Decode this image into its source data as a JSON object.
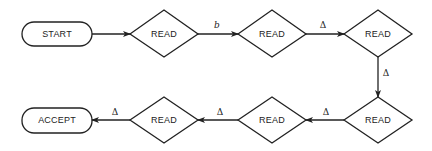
{
  "diagram": {
    "nodes": [
      {
        "id": "start",
        "type": "terminal",
        "label": "START",
        "cx": 57,
        "cy": 34
      },
      {
        "id": "read1",
        "type": "decision",
        "label": "READ",
        "cx": 164,
        "cy": 34
      },
      {
        "id": "read2",
        "type": "decision",
        "label": "READ",
        "cx": 272,
        "cy": 34
      },
      {
        "id": "read3",
        "type": "decision",
        "label": "READ",
        "cx": 378,
        "cy": 34
      },
      {
        "id": "read4",
        "type": "decision",
        "label": "READ",
        "cx": 378,
        "cy": 120
      },
      {
        "id": "read5",
        "type": "decision",
        "label": "READ",
        "cx": 272,
        "cy": 120
      },
      {
        "id": "read6",
        "type": "decision",
        "label": "READ",
        "cx": 164,
        "cy": 120
      },
      {
        "id": "accept",
        "type": "terminal",
        "label": "ACCEPT",
        "cx": 57,
        "cy": 120
      }
    ],
    "edges": [
      {
        "from": "start",
        "to": "read1",
        "label": ""
      },
      {
        "from": "read1",
        "to": "read2",
        "label": "b"
      },
      {
        "from": "read2",
        "to": "read3",
        "label": "Δ"
      },
      {
        "from": "read3",
        "to": "read4",
        "label": "Δ"
      },
      {
        "from": "read4",
        "to": "read5",
        "label": "Δ"
      },
      {
        "from": "read5",
        "to": "read6",
        "label": "Δ"
      },
      {
        "from": "read6",
        "to": "accept",
        "label": "Δ"
      }
    ]
  }
}
